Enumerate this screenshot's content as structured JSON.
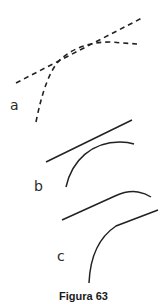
{
  "figure": {
    "caption": "Figura 63",
    "stroke_color": "#222222",
    "panels": [
      {
        "label": "a",
        "style": "dashed",
        "description": "dashed straight line with a dashed curve tangent to it"
      },
      {
        "label": "b",
        "style": "solid",
        "description": "solid straight line separate from a solid curve"
      },
      {
        "label": "c",
        "style": "solid",
        "description": "two solid lines each combining a straight segment and a curve"
      }
    ]
  }
}
